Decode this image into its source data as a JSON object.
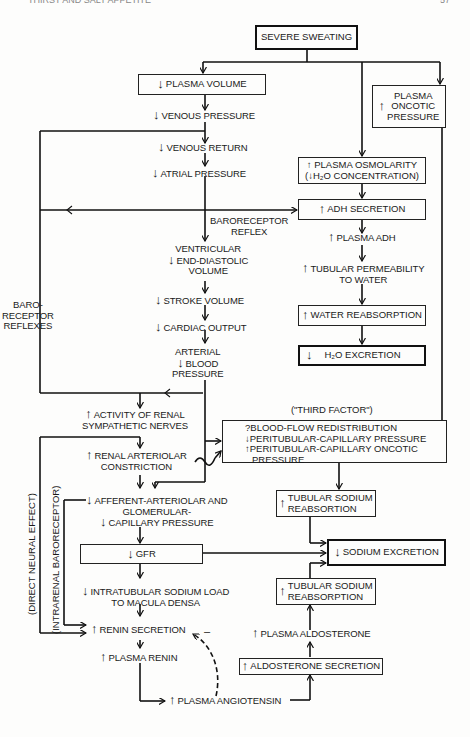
{
  "header": {
    "left": "THIRST AND SALT APPETITE",
    "right": "57"
  },
  "arrows": {
    "up": "↑",
    "down": "↓"
  },
  "nodes": {
    "severe_sweating": "SEVERE SWEATING",
    "plasma_volume": "PLASMA VOLUME",
    "plasma_oncotic": [
      "PLASMA",
      "ONCOTIC",
      "PRESSURE"
    ],
    "venous_pressure": "VENOUS PRESSURE",
    "venous_return": "VENOUS RETURN",
    "atrial_pressure": "ATRIAL PRESSURE",
    "plasma_osmolarity": [
      "PLASMA OSMOLARITY",
      "(↓H₂O CONCENTRATION)"
    ],
    "baroreceptor_reflex": [
      "BARORECEPTOR",
      "REFLEX"
    ],
    "adh_secretion": "ADH SECRETION",
    "plasma_adh": "PLASMA ADH",
    "tubular_permeability": [
      "TUBULAR PERMEABILITY",
      "TO WATER"
    ],
    "water_reabsorption": "WATER REABSORPTION",
    "h2o_excretion": "H₂O EXCRETION",
    "ventricular_edv": [
      "VENTRICULAR",
      "END-DIASTOLIC",
      "VOLUME"
    ],
    "stroke_volume": "STROKE VOLUME",
    "cardiac_output": "CARDIAC OUTPUT",
    "arterial_bp": [
      "ARTERIAL",
      "BLOOD",
      "PRESSURE"
    ],
    "baroreceptor_reflexes": [
      "BARO-",
      "RECEPTOR",
      "REFLEXES"
    ],
    "renal_sympathetic": [
      "ACTIVITY OF RENAL",
      "SYMPATHETIC NERVES"
    ],
    "third_factor_title": "(\"THIRD FACTOR\")",
    "third_factor_items": [
      {
        "prefix": "?",
        "text": "BLOOD-FLOW REDISTRIBUTION"
      },
      {
        "prefix": "↓",
        "text": "PERITUBULAR-CAPILLARY PRESSURE"
      },
      {
        "prefix": "↑",
        "text": "PERITUBULAR-CAPILLARY ONCOTIC"
      },
      {
        "prefix": "",
        "text": "PRESSURE"
      }
    ],
    "renal_arteriolar": [
      "RENAL ARTERIOLAR",
      "CONSTRICTION"
    ],
    "afferent_arteriolar": [
      "AFFERENT-ARTERIOLAR AND",
      "GLOMERULAR-",
      "CAPILLARY PRESSURE"
    ],
    "tubular_sodium_reab_1": [
      "TUBULAR SODIUM",
      "REABSORTION"
    ],
    "gfr": "GFR",
    "sodium_excretion": "SODIUM EXCRETION",
    "intratubular_sodium": [
      "INTRATUBULAR SODIUM LOAD",
      "TO MACULA DENSA"
    ],
    "tubular_sodium_reab_2": [
      "TUBULAR SODIUM",
      "REABSORPTION"
    ],
    "renin_secretion": "RENIN SECRETION",
    "plasma_aldosterone": "PLASMA ALDOSTERONE",
    "plasma_renin": "PLASMA RENIN",
    "aldosterone_secretion": "ALDOSTERONE SECRETION",
    "plasma_angiotensin": "PLASMA ANGIOTENSIN",
    "minus_sign": "–",
    "direct_neural": "(DIRECT NEURAL EFFECT)",
    "intrarenal_baroreceptor": "(INTRARENAL BARORECEPTOR)"
  },
  "colors": {
    "ink": "#1a1a1a",
    "paper": "#fdfdfc"
  }
}
